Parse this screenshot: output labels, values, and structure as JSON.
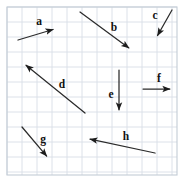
{
  "figure": {
    "width": 185,
    "height": 182,
    "background_color": "#ffffff",
    "grid": {
      "line_color": "#d8dee6",
      "frame_color": "#c3ccd6",
      "cell_size": 15,
      "x_start": 7,
      "y_start": 7,
      "x_end": 177,
      "y_end": 175,
      "columns": 11,
      "rows": 11
    },
    "vector_color": "#1c1c1c",
    "label_color": "#111111"
  },
  "chart_data": {
    "type": "diagram",
    "xlabel": "",
    "ylabel": "",
    "grid": true,
    "grid_cell_px": 15,
    "legend": "none",
    "vectors": [
      {
        "name": "a",
        "label": "a",
        "tail_x": 18,
        "tail_y": 40,
        "head_x": 58,
        "head_y": 28,
        "label_x": 39,
        "label_y": 22,
        "direction": "up-right",
        "dx_cells": 2.7,
        "dy_cells": 0.8
      },
      {
        "name": "b",
        "label": "b",
        "tail_x": 80,
        "tail_y": 12,
        "head_x": 133,
        "head_y": 51,
        "label_x": 114,
        "label_y": 28,
        "direction": "down-right",
        "dx_cells": 3.5,
        "dy_cells": -2.6
      },
      {
        "name": "c",
        "label": "c",
        "tail_x": 172,
        "tail_y": 10,
        "head_x": 155,
        "head_y": 40,
        "label_x": 155,
        "label_y": 16,
        "direction": "down-left",
        "dx_cells": -1.1,
        "dy_cells": -2.0
      },
      {
        "name": "d",
        "label": "d",
        "tail_x": 85,
        "tail_y": 113,
        "head_x": 22,
        "head_y": 62,
        "label_x": 62,
        "label_y": 85,
        "direction": "up-left",
        "dx_cells": -4.2,
        "dy_cells": 3.4
      },
      {
        "name": "e",
        "label": "e",
        "tail_x": 119,
        "tail_y": 70,
        "head_x": 119,
        "head_y": 115,
        "label_x": 111,
        "label_y": 95,
        "direction": "down",
        "dx_cells": 0,
        "dy_cells": -3.0
      },
      {
        "name": "f",
        "label": "f",
        "tail_x": 143,
        "tail_y": 89,
        "head_x": 175,
        "head_y": 89,
        "label_x": 159,
        "label_y": 79,
        "direction": "right",
        "dx_cells": 2.1,
        "dy_cells": 0
      },
      {
        "name": "g",
        "label": "g",
        "tail_x": 22,
        "tail_y": 127,
        "head_x": 50,
        "head_y": 160,
        "label_x": 43,
        "label_y": 140,
        "direction": "down-right",
        "dx_cells": 1.9,
        "dy_cells": -2.2
      },
      {
        "name": "h",
        "label": "h",
        "tail_x": 155,
        "tail_y": 153,
        "head_x": 85,
        "head_y": 138,
        "label_x": 126,
        "label_y": 137,
        "direction": "left",
        "dx_cells": -4.7,
        "dy_cells": 1.0
      }
    ]
  }
}
